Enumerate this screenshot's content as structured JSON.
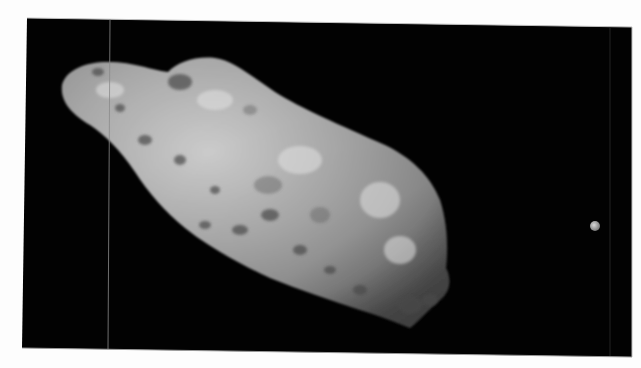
{
  "image": {
    "subject": "asteroid with small moon against black space",
    "background_color": "#ffffff",
    "space_color": "#020202",
    "asteroid": {
      "base_color": "#9a9a9a",
      "highlight_color": "#d2d2d2",
      "shadow_color": "#3a3a3a"
    },
    "moon": {
      "color": "#b8b8b8",
      "cx": 595,
      "cy": 226,
      "r": 5
    },
    "frame": {
      "top_left": [
        27,
        18
      ],
      "top_right": [
        632,
        27
      ],
      "bottom_right": [
        632,
        357
      ],
      "bottom_left": [
        22,
        348
      ]
    }
  }
}
